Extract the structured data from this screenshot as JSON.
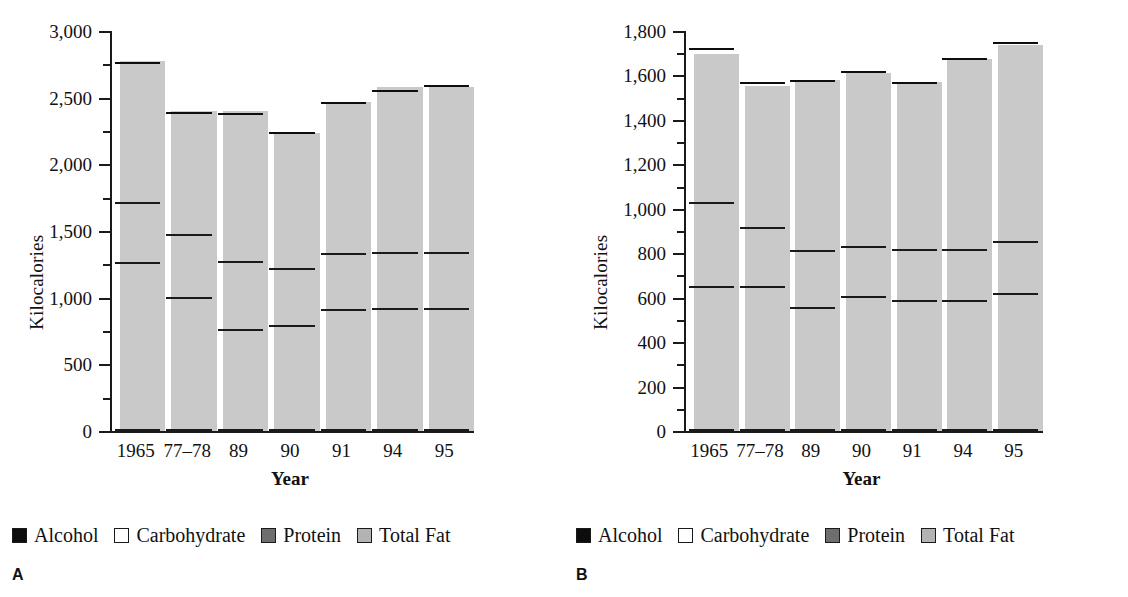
{
  "figure": {
    "panels": [
      {
        "letter": "A",
        "chart_data": {
          "type": "bar",
          "subtype": "stacked-vertical",
          "title": "",
          "xlabel": "Year",
          "ylabel": "Kilocalories",
          "categories": [
            "1965",
            "77–78",
            "89",
            "90",
            "91",
            "94",
            "95"
          ],
          "ylim": [
            0,
            3000
          ],
          "ytick_values": [
            0,
            500,
            1000,
            1500,
            2000,
            2500,
            3000
          ],
          "ytick_labels": [
            "0",
            "500",
            "1,000",
            "1,500",
            "2,000",
            "2,500",
            "3,000"
          ],
          "yminor_step": 250,
          "grid": false,
          "legend_position": "below",
          "series": [
            {
              "name": "Total Fat",
              "color": "#b3b3b3",
              "values": [
                1250,
                990,
                750,
                780,
                900,
                910,
                910
              ]
            },
            {
              "name": "Protein",
              "color": "#6e6e6e",
              "values": [
                450,
                470,
                510,
                425,
                420,
                415,
                415
              ]
            },
            {
              "name": "Carbohydrate",
              "color": "#ffffff",
              "values": [
                1050,
                920,
                1110,
                1020,
                1130,
                1220,
                1255
              ]
            },
            {
              "name": "Alcohol",
              "color": "#0d0d0d",
              "values": [
                60,
                60,
                70,
                45,
                55,
                70,
                35
              ]
            }
          ],
          "totals": [
            2810,
            2440,
            2440,
            2270,
            2505,
            2615,
            2615
          ]
        }
      },
      {
        "letter": "B",
        "chart_data": {
          "type": "bar",
          "subtype": "stacked-vertical",
          "title": "",
          "xlabel": "Year",
          "ylabel": "Kilocalories",
          "categories": [
            "1965",
            "77–78",
            "89",
            "90",
            "91",
            "94",
            "95"
          ],
          "ylim": [
            0,
            1800
          ],
          "ytick_values": [
            0,
            200,
            400,
            600,
            800,
            1000,
            1200,
            1400,
            1600,
            1800
          ],
          "ytick_labels": [
            "0",
            "200",
            "400",
            "600",
            "800",
            "1,000",
            "1,200",
            "1,400",
            "1,600",
            "1,800"
          ],
          "yminor_step": 100,
          "grid": false,
          "legend_position": "below",
          "series": [
            {
              "name": "Total Fat",
              "color": "#b3b3b3",
              "values": [
                645,
                645,
                550,
                600,
                580,
                580,
                610
              ]
            },
            {
              "name": "Protein",
              "color": "#6e6e6e",
              "values": [
                375,
                265,
                255,
                225,
                230,
                230,
                235
              ]
            },
            {
              "name": "Carbohydrate",
              "color": "#ffffff",
              "values": [
                695,
                650,
                765,
                785,
                750,
                860,
                895
              ]
            },
            {
              "name": "Alcohol",
              "color": "#0d0d0d",
              "values": [
                5,
                15,
                30,
                25,
                35,
                25,
                20
              ]
            }
          ],
          "totals": [
            1720,
            1575,
            1600,
            1635,
            1595,
            1695,
            1760
          ]
        }
      }
    ],
    "legend": {
      "items": [
        {
          "label": "Alcohol",
          "swatch": "sw-alcohol",
          "icon": "black-square-swatch-icon"
        },
        {
          "label": "Carbohydrate",
          "swatch": "sw-carb",
          "icon": "white-square-swatch-icon"
        },
        {
          "label": "Protein",
          "swatch": "sw-protein",
          "icon": "dark-gray-square-swatch-icon"
        },
        {
          "label": "Total Fat",
          "swatch": "sw-fat",
          "icon": "light-gray-square-swatch-icon"
        }
      ]
    },
    "colors": {
      "alcohol": "#0d0d0d",
      "carbohydrate": "#ffffff",
      "protein": "#6e6e6e",
      "total_fat": "#b3b3b3",
      "axis": "#1a1a1a",
      "shadow": "#c9c9c9",
      "background": "#ffffff"
    }
  }
}
